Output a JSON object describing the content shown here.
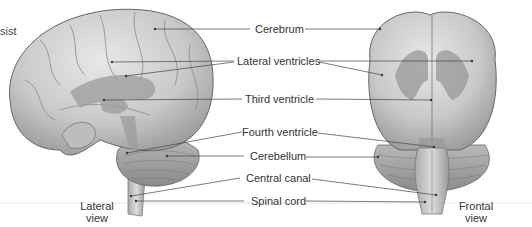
{
  "figure": {
    "fragment_text": "sist",
    "labels": [
      {
        "id": "cerebrum",
        "text": "Cerebrum"
      },
      {
        "id": "lateral-ventricles",
        "text": "Lateral ventricles"
      },
      {
        "id": "third-ventricle",
        "text": "Third ventricle"
      },
      {
        "id": "fourth-ventricle",
        "text": "Fourth ventricle"
      },
      {
        "id": "cerebellum",
        "text": "Cerebellum"
      },
      {
        "id": "central-canal",
        "text": "Central canal"
      },
      {
        "id": "spinal-cord",
        "text": "Spinal cord"
      }
    ],
    "views": {
      "lateral": {
        "line1": "Lateral",
        "line2": "view"
      },
      "frontal": {
        "line1": "Frontal",
        "line2": "view"
      }
    }
  }
}
